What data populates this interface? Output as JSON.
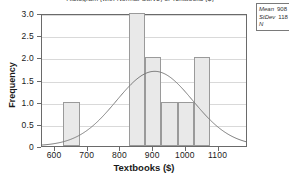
{
  "chart_data": {
    "type": "bar",
    "title": "Histogram (with Normal Curve) of Textbooks ($)",
    "xlabel": "Textbooks ($)",
    "ylabel": "Frequency",
    "xlim": [
      560,
      1190
    ],
    "ylim": [
      0,
      3.0
    ],
    "grid": true,
    "legend_position": "top-right-outside",
    "bin_width": 50,
    "categories": [
      "625-675",
      "675-725",
      "725-775",
      "775-825",
      "825-875",
      "875-925",
      "925-975",
      "975-1025",
      "1025-1075"
    ],
    "bin_starts": [
      625,
      675,
      725,
      775,
      825,
      875,
      925,
      975,
      1025
    ],
    "values": [
      1,
      0,
      0,
      0,
      3,
      2,
      1,
      1,
      2
    ],
    "x_ticks": [
      600,
      700,
      800,
      900,
      1000,
      1100
    ],
    "x_tick_labels": [
      "600",
      "700",
      "800",
      "900",
      "1000",
      "1100"
    ],
    "y_ticks": [
      0,
      0.5,
      1.0,
      1.5,
      2.0,
      2.5,
      3.0
    ],
    "y_tick_labels": [
      "0",
      "0.5",
      "1.0",
      "1.5",
      "2.0",
      "2.5",
      "3.0"
    ],
    "overlay": {
      "type": "normal-curve",
      "mean": 908,
      "stdev": 118,
      "peak_value": 1.71,
      "color": "#7a7a7a"
    },
    "annotations": {
      "mean_label": "Mean",
      "mean_value": "908",
      "stdev_label": "StDev",
      "stdev_value": "118",
      "n_label": "N",
      "n_value": ""
    },
    "colors": {
      "bar_fill": "#e9e9e9",
      "bar_border": "#9a9a9a",
      "grid": "#d9d9d9",
      "frame": "#6a6a6a",
      "text": "#1a1a1a"
    }
  }
}
